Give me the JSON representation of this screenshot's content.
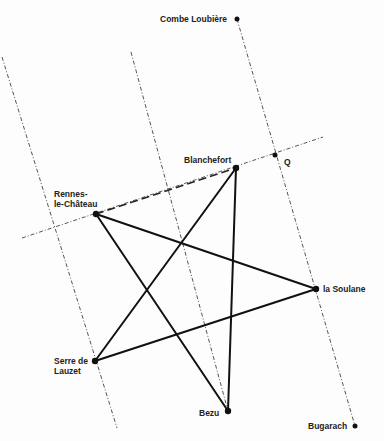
{
  "diagram": {
    "points": {
      "combe_loubiere": {
        "label": "Combe Loubière",
        "x": 237,
        "y": 19
      },
      "blanchefort": {
        "label": "Blanchefort",
        "x": 236,
        "y": 168
      },
      "q": {
        "label": "Q",
        "x": 275,
        "y": 155
      },
      "rennes": {
        "label": "Rennes-\nle-Château",
        "x": 96,
        "y": 214
      },
      "la_soulane": {
        "label": "la Soulane",
        "x": 316,
        "y": 289
      },
      "serre": {
        "label": "Serre de\nLauzet",
        "x": 95,
        "y": 361
      },
      "bezu": {
        "label": "Bezu",
        "x": 228,
        "y": 411
      },
      "bugarach": {
        "label": "Bugarach",
        "x": 355,
        "y": 426
      }
    },
    "pentagram_edges": [
      [
        "rennes",
        "la_soulane"
      ],
      [
        "la_soulane",
        "serre"
      ],
      [
        "serre",
        "blanchefort"
      ],
      [
        "blanchefort",
        "bezu"
      ],
      [
        "bezu",
        "rennes"
      ]
    ],
    "parallel_lines": [
      {
        "from": [
          2,
          57
        ],
        "to": [
          117,
          428
        ]
      },
      {
        "from": [
          131,
          52
        ],
        "to": [
          228,
          411
        ]
      },
      {
        "from": [
          237,
          19
        ],
        "to": [
          355,
          426
        ]
      }
    ],
    "baseline": {
      "from": [
        22,
        238
      ],
      "to": [
        323,
        137
      ],
      "dashed_segment": [
        "rennes",
        "blanchefort"
      ]
    }
  }
}
